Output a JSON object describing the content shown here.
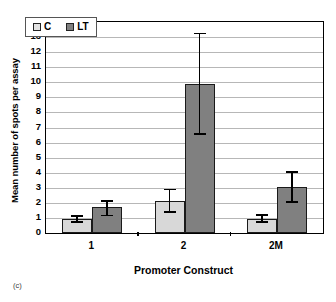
{
  "figure": {
    "panel_label": "(c)"
  },
  "chart_data": {
    "type": "bar",
    "title": "",
    "xlabel": "Promoter Construct",
    "ylabel": "Mean number of spots per assay",
    "categories": [
      "1",
      "2",
      "2M"
    ],
    "ylim": [
      0,
      14
    ],
    "yticks": [
      0,
      1,
      2,
      3,
      4,
      5,
      6,
      7,
      8,
      9,
      10,
      11,
      12,
      13,
      14
    ],
    "ytick_labels": [
      "0",
      "1",
      "2",
      "3",
      "4",
      "5",
      "6",
      "7",
      "8",
      "9",
      "10",
      "11",
      "12",
      "13",
      "14"
    ],
    "grid": true,
    "grid_axis": "y",
    "legend_position": "upper left",
    "series": [
      {
        "name": "C",
        "color": "#d8d8d8",
        "values": [
          0.9,
          2.15,
          0.95
        ],
        "error_low": [
          0.65,
          1.35,
          0.65
        ],
        "error_high": [
          1.2,
          2.95,
          1.25
        ]
      },
      {
        "name": "LT",
        "color": "#808080",
        "values": [
          1.7,
          9.9,
          3.05
        ],
        "error_low": [
          1.1,
          6.5,
          2.0
        ],
        "error_high": [
          2.2,
          13.3,
          4.1
        ]
      }
    ]
  }
}
